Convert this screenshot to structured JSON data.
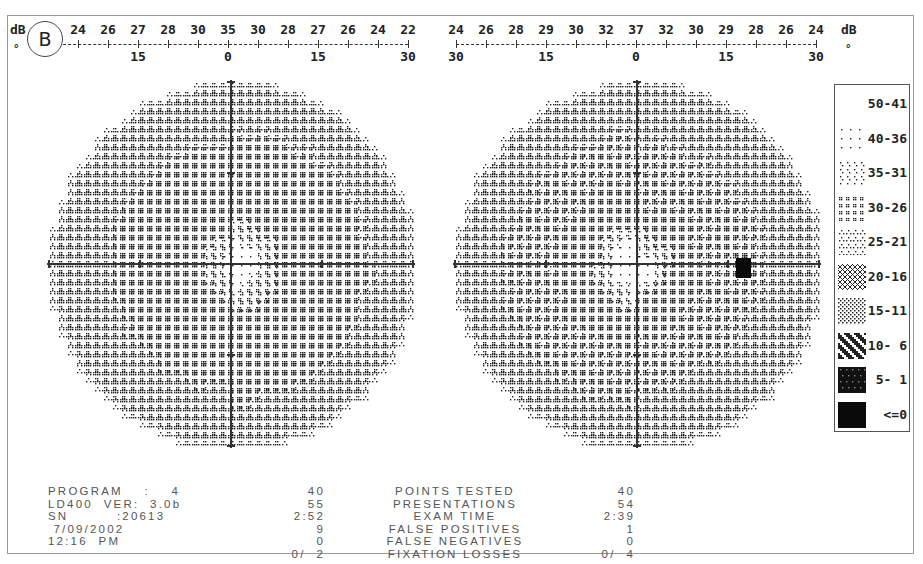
{
  "header": {
    "eye_badge": "B",
    "db_unit": "dB",
    "deg_unit": "°"
  },
  "left_scale": {
    "db_values": [
      "22",
      "24",
      "26",
      "27",
      "28",
      "30",
      "35",
      "30",
      "28",
      "27",
      "26",
      "24",
      "22"
    ],
    "deg_labels": [
      {
        "pos": 0,
        "label": ""
      },
      {
        "pos": 3,
        "label": "15"
      },
      {
        "pos": 6,
        "label": "0"
      },
      {
        "pos": 9,
        "label": "15"
      },
      {
        "pos": 12,
        "label": "30"
      }
    ]
  },
  "right_scale": {
    "db_values": [
      "24",
      "26",
      "28",
      "29",
      "30",
      "32",
      "37",
      "32",
      "30",
      "29",
      "28",
      "26",
      "24"
    ],
    "deg_labels": [
      {
        "pos": 0,
        "label": "30"
      },
      {
        "pos": 3,
        "label": "15"
      },
      {
        "pos": 6,
        "label": "0"
      },
      {
        "pos": 9,
        "label": "15"
      },
      {
        "pos": 12,
        "label": "30"
      }
    ]
  },
  "legend": {
    "items": [
      {
        "label": "50-41",
        "pattern": "blank"
      },
      {
        "label": "40-36",
        "pattern": "sparse-dots"
      },
      {
        "label": "35-31",
        "pattern": "light-dots"
      },
      {
        "label": "30-26",
        "pattern": "double-dots"
      },
      {
        "label": "25-21",
        "pattern": "triangles"
      },
      {
        "label": "20-16",
        "pattern": "crosshatch"
      },
      {
        "label": "15-11",
        "pattern": "dense-gray"
      },
      {
        "label": "10- 6",
        "pattern": "dark-mottled"
      },
      {
        "label": "5- 1",
        "pattern": "near-black"
      },
      {
        "label": "<=0",
        "pattern": "solid-black"
      }
    ]
  },
  "stats_left": {
    "lines": [
      "PROGRAM    :    4",
      "LD400  VER:  3.0b",
      "SN         :20613",
      " 7/09/2002",
      "12:16  PM",
      ""
    ]
  },
  "stats_labels": {
    "left_values": [
      "40",
      "55",
      "2:52",
      "9",
      "0",
      "0/  2"
    ],
    "labels": [
      "POINTS TESTED",
      "PRESENTATIONS",
      "EXAM TIME",
      "FALSE POSITIVES",
      "FALSE NEGATIVES",
      "FIXATION LOSSES"
    ],
    "right_values": [
      "40",
      "54",
      "2:39",
      "1",
      "0",
      "0/  4"
    ]
  },
  "chart_data": {
    "type": "heatmap",
    "xlabel": "Eccentricity (degrees)",
    "ylabel": "",
    "legend_position": "right",
    "legend": [
      "50-41",
      "40-36",
      "35-31",
      "30-26",
      "25-21",
      "20-16",
      "15-11",
      "10- 6",
      "5- 1",
      "<=0"
    ],
    "fields": [
      {
        "name": "left-field",
        "x_ticks_deg": [
          30,
          15,
          0,
          15,
          30
        ],
        "axis_db_profile": [
          22,
          24,
          26,
          27,
          28,
          30,
          35,
          30,
          28,
          27,
          26,
          24,
          22
        ],
        "peripheral_ring_class": "25-21",
        "mid_zone_class": "30-26",
        "central_class": "35-31",
        "defects": []
      },
      {
        "name": "right-field",
        "x_ticks_deg": [
          30,
          15,
          0,
          15,
          30
        ],
        "axis_db_profile": [
          24,
          26,
          28,
          29,
          30,
          32,
          37,
          32,
          30,
          29,
          28,
          26,
          24
        ],
        "peripheral_ring_class": "25-21",
        "mid_zone_class": "30-26",
        "central_class": "35-31",
        "defects": [
          {
            "location": "temporal ~15°, just below horizontal meridian",
            "class": "<=0",
            "note": "blind spot"
          }
        ]
      }
    ]
  },
  "render": {
    "left_field": {
      "cx": 231,
      "cy": 264,
      "r": 182
    },
    "right_field": {
      "cx": 637,
      "cy": 264,
      "r": 182,
      "blind_spot": {
        "x": 736,
        "y": 258,
        "w": 15,
        "h": 20
      }
    }
  }
}
